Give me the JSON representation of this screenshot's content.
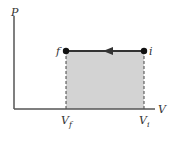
{
  "diagram": {
    "type": "pv-diagram",
    "axes": {
      "y_label": "P",
      "x_label": "V"
    },
    "points": [
      {
        "id": "f",
        "label": "f"
      },
      {
        "id": "i",
        "label": "i"
      }
    ],
    "x_ticks": {
      "final": {
        "main": "V",
        "sub": "f"
      },
      "initial": {
        "main": "V",
        "sub": "i"
      }
    },
    "process": {
      "direction": "i-to-f",
      "kind": "isobaric compression"
    },
    "colors": {
      "shade": "#d3d3d3",
      "line": "#333333",
      "axis": "#555555"
    }
  }
}
